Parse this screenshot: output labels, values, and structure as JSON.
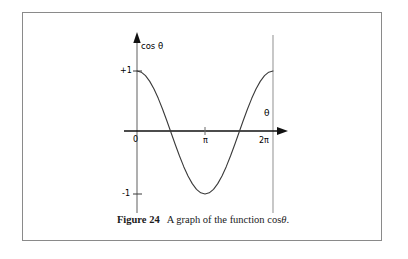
{
  "figure": {
    "caption_label": "Figure 24",
    "caption_text": "A graph of the function cos",
    "caption_symbol": "θ",
    "caption_end": "."
  },
  "chart_data": {
    "type": "line",
    "xlabel": "θ",
    "ylabel": "cos θ",
    "xlim": [
      0,
      6.283185307179586
    ],
    "ylim": [
      -1,
      1
    ],
    "grid": false,
    "legend": "none",
    "xtick_labels": [
      "0",
      "π",
      "2π"
    ],
    "xtick_values": [
      0,
      3.141592653589793,
      6.283185307179586
    ],
    "ytick_labels": [
      "+1",
      "-1"
    ],
    "ytick_values": [
      1,
      -1
    ],
    "series": [
      {
        "name": "cos θ",
        "color": "#3a3a3a",
        "x": [
          0,
          0.1963,
          0.3927,
          0.589,
          0.7854,
          0.9817,
          1.1781,
          1.3744,
          1.5708,
          1.7671,
          1.9635,
          2.1598,
          2.3562,
          2.5525,
          2.7489,
          2.9452,
          3.1416,
          3.3379,
          3.5343,
          3.7306,
          3.927,
          4.1233,
          4.3197,
          4.516,
          4.7124,
          4.9087,
          5.1051,
          5.3014,
          5.4978,
          5.6941,
          5.8905,
          6.0868,
          6.2832
        ],
        "y": [
          1.0,
          0.9808,
          0.9239,
          0.8315,
          0.7071,
          0.5556,
          0.3827,
          0.1951,
          0.0,
          -0.1951,
          -0.3827,
          -0.5556,
          -0.7071,
          -0.8315,
          -0.9239,
          -0.9808,
          -1.0,
          -0.9808,
          -0.9239,
          -0.8315,
          -0.7071,
          -0.5556,
          -0.3827,
          -0.1951,
          0.0,
          0.1951,
          0.3827,
          0.5556,
          0.7071,
          0.8315,
          0.9239,
          0.9808,
          1.0
        ]
      }
    ],
    "annotations": {
      "y_axis_label": "cos θ",
      "x_axis_label": "θ",
      "peak_value": "+1",
      "trough_value": "-1",
      "origin_label": "0"
    },
    "colors": {
      "curve": "#3a3a3a",
      "x_axis": "#000000",
      "y_axis": "#8d8d8d",
      "right_rule": "#9a9a9a",
      "frame": "#8a8a8a"
    }
  }
}
